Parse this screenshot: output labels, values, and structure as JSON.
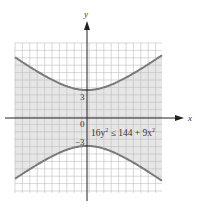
{
  "chart_data": {
    "type": "line",
    "title": "",
    "xlabel": "x",
    "ylabel": "y",
    "inequality": "16y² ≤ 144 + 9x²",
    "curve": "hyperbola 16y² − 9x² = 144",
    "vertices": [
      [
        0,
        3
      ],
      [
        0,
        -3
      ]
    ],
    "tick_labels": {
      "y_pos": "3",
      "y_neg": "−3",
      "origin": "0"
    },
    "shaded_region": "between branches (|y| ≤ (3/4)√(16 + x²))",
    "xlim": [
      -8,
      8
    ],
    "ylim": [
      -8,
      8
    ],
    "grid": true,
    "colors": {
      "curve": "#7a7a7a",
      "shade": "#e6e6e6",
      "grid": "#bdbdbd",
      "axis": "#222222"
    }
  },
  "labels": {
    "x_axis": "x",
    "y_axis": "y",
    "origin": "0",
    "y_pos": "3",
    "y_neg": "−3",
    "eq_main": "16y",
    "eq_sup1": "2",
    "eq_rest": " ≤ 144 + 9x",
    "eq_sup2": "2"
  }
}
